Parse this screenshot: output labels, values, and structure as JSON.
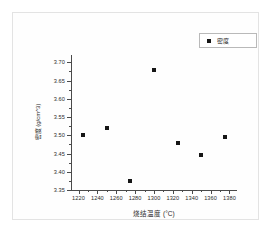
{
  "chart_data": {
    "type": "scatter",
    "title": "",
    "xlabel": "烧结温度 (°C)",
    "ylabel": "密度 (g/cm^3)",
    "xlim": [
      1212,
      1388
    ],
    "ylim": [
      3.35,
      3.72
    ],
    "grid": false,
    "legend_position": "top-right",
    "series": [
      {
        "name": "密度",
        "marker": "filled-square",
        "color": "#161616",
        "x": [
          1225,
          1250,
          1275,
          1300,
          1325,
          1350,
          1375
        ],
        "y": [
          3.5,
          3.52,
          3.375,
          3.68,
          3.48,
          3.445,
          3.495
        ]
      }
    ],
    "x_ticks": [
      "1220",
      "1240",
      "1260",
      "1280",
      "1300",
      "1320",
      "1340",
      "1360",
      "1380"
    ],
    "x_tick_values": [
      1220,
      1240,
      1260,
      1280,
      1300,
      1320,
      1340,
      1360,
      1380
    ],
    "y_ticks": [
      "3.35",
      "3.40",
      "3.45",
      "3.50",
      "3.55",
      "3.60",
      "3.65",
      "3.70"
    ],
    "y_tick_values": [
      3.35,
      3.4,
      3.45,
      3.5,
      3.55,
      3.6,
      3.65,
      3.7
    ]
  },
  "legend": {
    "entries": [
      {
        "label": "密度",
        "marker": "filled-square"
      }
    ]
  },
  "colors": {
    "marker": "#161616",
    "axis": "#4a4a4a",
    "frame": "#e3e3e3",
    "background": "#ffffff"
  }
}
